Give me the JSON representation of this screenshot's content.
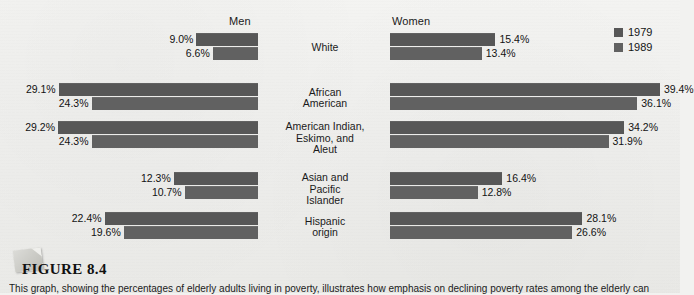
{
  "figure": {
    "title": "FIGURE 8.4",
    "caption": "This graph, showing the percentages of elderly adults living in poverty, illustrates how emphasis on declining poverty rates among the elderly can"
  },
  "headers": {
    "men": "Men",
    "women": "Women"
  },
  "legend": {
    "position": "top-right",
    "items": [
      {
        "label": "1979",
        "color": "#575757"
      },
      {
        "label": "1989",
        "color": "#616161"
      }
    ]
  },
  "chart_data": {
    "type": "bar",
    "title": "",
    "xlabel": "",
    "ylabel": "",
    "orientation": "horizontal",
    "grid": false,
    "legend_position": "top-right",
    "panels": [
      "Men",
      "Women"
    ],
    "categories": [
      "White",
      "African American",
      "American Indian, Eskimo, and Aleut",
      "Asian and Pacific Islander",
      "Hispanic origin"
    ],
    "series": [
      {
        "name": "1979",
        "panel": "Men",
        "values": [
          9.0,
          29.1,
          29.2,
          12.3,
          22.4
        ]
      },
      {
        "name": "1989",
        "panel": "Men",
        "values": [
          6.6,
          24.3,
          24.3,
          10.7,
          19.6
        ]
      },
      {
        "name": "1979",
        "panel": "Women",
        "values": [
          15.4,
          39.4,
          34.2,
          16.4,
          28.1
        ]
      },
      {
        "name": "1989",
        "panel": "Women",
        "values": [
          13.4,
          36.1,
          31.9,
          12.8,
          26.6
        ]
      }
    ],
    "value_labels": {
      "men_1979": [
        "9.0%",
        "29.1%",
        "29.2%",
        "12.3%",
        "22.4%"
      ],
      "men_1989": [
        "6.6%",
        "24.3%",
        "24.3%",
        "10.7%",
        "19.6%"
      ],
      "women_1979": [
        "15.4%",
        "39.4%",
        "34.2%",
        "16.4%",
        "28.1%"
      ],
      "women_1989": [
        "13.4%",
        "36.1%",
        "31.9%",
        "12.8%",
        "26.6%"
      ]
    },
    "xlim": [
      0,
      40
    ],
    "unit": "percent"
  },
  "rows": [
    {
      "label_lines": [
        "White"
      ],
      "men": {
        "y1979": {
          "value": 9.0,
          "label": "9.0%"
        },
        "y1989": {
          "value": 6.6,
          "label": "6.6%"
        }
      },
      "women": {
        "y1979": {
          "value": 15.4,
          "label": "15.4%"
        },
        "y1989": {
          "value": 13.4,
          "label": "13.4%"
        }
      }
    },
    {
      "label_lines": [
        "African",
        "American"
      ],
      "men": {
        "y1979": {
          "value": 29.1,
          "label": "29.1%"
        },
        "y1989": {
          "value": 24.3,
          "label": "24.3%"
        }
      },
      "women": {
        "y1979": {
          "value": 39.4,
          "label": "39.4%"
        },
        "y1989": {
          "value": 36.1,
          "label": "36.1%"
        }
      }
    },
    {
      "label_lines": [
        "American Indian,",
        "Eskimo, and",
        "Aleut"
      ],
      "men": {
        "y1979": {
          "value": 29.2,
          "label": "29.2%"
        },
        "y1989": {
          "value": 24.3,
          "label": "24.3%"
        }
      },
      "women": {
        "y1979": {
          "value": 34.2,
          "label": "34.2%"
        },
        "y1989": {
          "value": 31.9,
          "label": "31.9%"
        }
      }
    },
    {
      "label_lines": [
        "Asian and",
        "Pacific",
        "Islander"
      ],
      "men": {
        "y1979": {
          "value": 12.3,
          "label": "12.3%"
        },
        "y1989": {
          "value": 10.7,
          "label": "10.7%"
        }
      },
      "women": {
        "y1979": {
          "value": 16.4,
          "label": "16.4%"
        },
        "y1989": {
          "value": 12.8,
          "label": "12.8%"
        }
      }
    },
    {
      "label_lines": [
        "Hispanic",
        "origin"
      ],
      "men": {
        "y1979": {
          "value": 22.4,
          "label": "22.4%"
        },
        "y1989": {
          "value": 19.6,
          "label": "19.6%"
        }
      },
      "women": {
        "y1979": {
          "value": 28.1,
          "label": "28.1%"
        },
        "y1989": {
          "value": 26.6,
          "label": "26.6%"
        }
      }
    }
  ]
}
